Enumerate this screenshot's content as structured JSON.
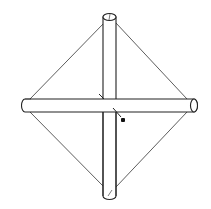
{
  "diagram": {
    "subject": "kite frame",
    "components": [
      {
        "id": "vertical-stick",
        "label": "spine"
      },
      {
        "id": "horizontal-stick",
        "label": "spar"
      },
      {
        "id": "frame-string",
        "label": "string"
      },
      {
        "id": "center-tie",
        "label": "tie"
      },
      {
        "id": "knot",
        "label": "knot"
      }
    ],
    "colors": {
      "line": "#222222",
      "background": "#ffffff",
      "knot": "#111111"
    }
  }
}
